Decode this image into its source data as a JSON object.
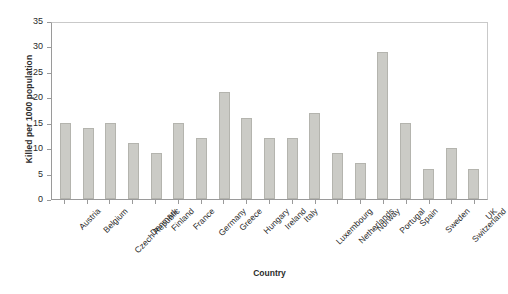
{
  "chart_data": {
    "type": "bar",
    "title": "",
    "xlabel": "Country",
    "ylabel": "Killed per 1000 population",
    "ylim": [
      0,
      35
    ],
    "ytick_step": 5,
    "yticks": [
      0,
      5,
      10,
      15,
      20,
      25,
      30,
      35
    ],
    "grid": false,
    "legend": null,
    "legend_position": "none",
    "categories": [
      "Austria",
      "Belgium",
      "Czech Republic",
      "Denmark",
      "Finland",
      "France",
      "Germany",
      "Greece",
      "Hungary",
      "Ireland",
      "Italy",
      "Luxembourg",
      "Netherlands",
      "Norway",
      "Portugal",
      "Spain",
      "Sweden",
      "Switzerland",
      "UK"
    ],
    "values": [
      15,
      14,
      15,
      11,
      9,
      15,
      12,
      21,
      16,
      12,
      12,
      17,
      9,
      7,
      29,
      15,
      6,
      10,
      6
    ],
    "series": [
      {
        "name": "Killed per 1000 population",
        "values": [
          15,
          14,
          15,
          11,
          9,
          15,
          12,
          21,
          16,
          12,
          12,
          17,
          9,
          7,
          29,
          15,
          6,
          10,
          6
        ]
      }
    ]
  },
  "style": {
    "bar_fill": "#cbcbc6",
    "bar_border": "#b4b4ae",
    "axis_color": "#9a9a9a",
    "text_color": "#2b2b2b",
    "background": "#ffffff"
  }
}
